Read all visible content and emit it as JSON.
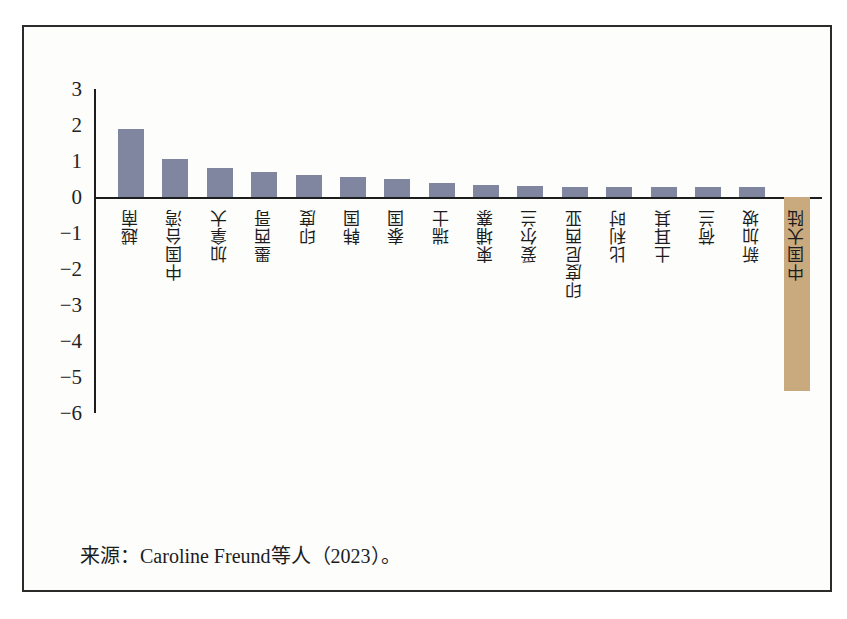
{
  "figure": {
    "source_note": "来源：Caroline Freund等人（2023）。",
    "colors": {
      "positive_bar": "#8186a0",
      "negative_bar": "#c9a97e",
      "axis": "#1d1d1d",
      "frame": "#2b2b2b",
      "background": "#fdfdfc"
    }
  },
  "chart_data": {
    "type": "bar",
    "title": "",
    "subtitle": "",
    "xlabel": "",
    "ylabel": "",
    "ylim": [
      -6,
      3
    ],
    "yticks": [
      3,
      2,
      1,
      0,
      -1,
      -2,
      -3,
      -4,
      -5,
      -6
    ],
    "ytick_labels": [
      "3",
      "2",
      "1",
      "0",
      "−1",
      "−2",
      "−3",
      "−4",
      "−5",
      "−6"
    ],
    "grid": false,
    "legend": null,
    "categories": [
      "越南",
      "中国台湾",
      "加拿大",
      "墨西哥",
      "印度",
      "韩国",
      "泰国",
      "瑞士",
      "柬埔寨",
      "爱尔兰",
      "印度尼西亚",
      "比利时",
      "土耳其",
      "荷兰",
      "新加坡",
      "中国大陆"
    ],
    "values": [
      1.9,
      1.05,
      0.8,
      0.7,
      0.6,
      0.55,
      0.5,
      0.4,
      0.33,
      0.3,
      0.28,
      0.28,
      0.27,
      0.27,
      0.27,
      -5.4
    ],
    "annotations": []
  }
}
